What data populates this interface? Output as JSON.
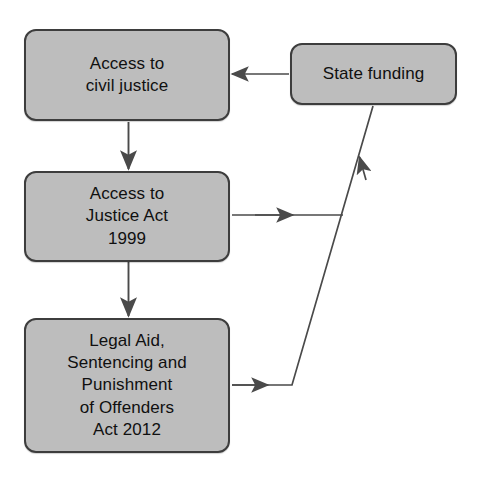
{
  "diagram": {
    "colors": {
      "node_fill": "#bdbdbd",
      "node_border": "#3d3d3d",
      "edge": "#4a4a4a",
      "text": "#101010",
      "background": "#ffffff"
    },
    "nodes": [
      {
        "id": "access-civil-justice",
        "label": "Access to\ncivil justice"
      },
      {
        "id": "state-funding",
        "label": "State funding"
      },
      {
        "id": "access-justice-act",
        "label": "Access to\nJustice Act\n1999"
      },
      {
        "id": "laspo",
        "label": "Legal Aid,\nSentencing and\nPunishment\nof Offenders\nAct 2012"
      }
    ],
    "edges": [
      {
        "id": "state-funding-to-access-civil-justice",
        "from": "state-funding",
        "to": "access-civil-justice",
        "direction": "left",
        "style": "solid"
      },
      {
        "id": "access-civil-justice-to-access-justice-act",
        "from": "access-civil-justice",
        "to": "access-justice-act",
        "direction": "down",
        "style": "solid"
      },
      {
        "id": "access-justice-act-to-state-funding",
        "from": "access-justice-act",
        "to": "state-funding",
        "direction": "right-up",
        "style": "solid"
      },
      {
        "id": "access-justice-act-to-laspo",
        "from": "access-justice-act",
        "to": "laspo",
        "direction": "down",
        "style": "solid"
      },
      {
        "id": "laspo-to-state-funding",
        "from": "laspo",
        "to": "state-funding",
        "direction": "right-up",
        "style": "solid"
      }
    ]
  }
}
